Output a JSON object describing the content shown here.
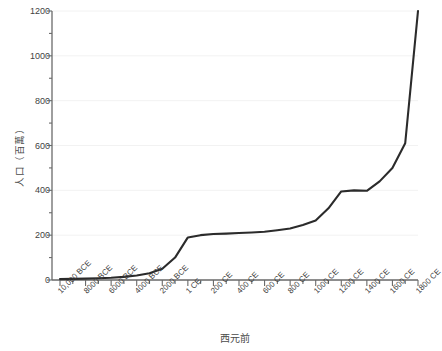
{
  "chart_data": {
    "type": "line",
    "title": "",
    "xlabel": "西元前",
    "ylabel": "人口（百萬）",
    "ylim": [
      0,
      1200
    ],
    "ytick_values": [
      0,
      200,
      400,
      600,
      800,
      1000,
      1200
    ],
    "ytick_labels": [
      "0",
      "200",
      "400",
      "600",
      "800",
      "1000",
      "1200"
    ],
    "yminor_step": 100,
    "grid": true,
    "legend": null,
    "xtick_labels": [
      "10,000 BCE",
      "8000 BCE",
      "6000 BCE",
      "4000 BCE",
      "2000 BCE",
      "1 CE",
      "200 CE",
      "400 CE",
      "600 CE",
      "800 CE",
      "1000 CE",
      "1200 CE",
      "1400 CE",
      "1600 CE",
      "1800 CE"
    ],
    "x": [
      -10000,
      -9000,
      -8000,
      -7000,
      -6000,
      -5000,
      -4000,
      -3000,
      -2000,
      -1000,
      1,
      100,
      200,
      300,
      400,
      500,
      600,
      700,
      800,
      900,
      1000,
      1100,
      1200,
      1300,
      1400,
      1500,
      1600,
      1700,
      1800
    ],
    "values": [
      4,
      5,
      6,
      8,
      10,
      14,
      20,
      30,
      50,
      100,
      190,
      200,
      205,
      207,
      210,
      212,
      215,
      222,
      230,
      245,
      265,
      320,
      395,
      400,
      398,
      440,
      500,
      610,
      1200
    ],
    "series_color": "#2b2b2b",
    "grid_color": "#f2f2f2",
    "axis_color": "#6a6a6a",
    "text_color": "#3f3f3f"
  }
}
